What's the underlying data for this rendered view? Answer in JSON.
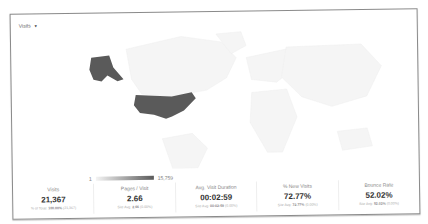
{
  "metric_selector": {
    "label": "Visits",
    "icon": "caret-down-icon"
  },
  "map": {
    "highlighted_regions": [
      "United States",
      "Alaska"
    ],
    "highlight_color": "#5a5a5a",
    "base_color": "#f4f4f4"
  },
  "legend": {
    "min": "1",
    "max": "15,759"
  },
  "metrics": [
    {
      "label": "Visits",
      "value": "21,367",
      "sub_prefix": "% of Total:",
      "sub_value": "100.00%",
      "sub_suffix": "(21,367)"
    },
    {
      "label": "Pages / Visit",
      "value": "2.66",
      "sub_prefix": "Site Avg:",
      "sub_value": "2.66",
      "sub_suffix": "(0.00%)"
    },
    {
      "label": "Avg. Visit Duration",
      "value": "00:02:59",
      "sub_prefix": "Site Avg:",
      "sub_value": "00:02:59",
      "sub_suffix": "(0.00%)"
    },
    {
      "label": "% New Visits",
      "value": "72.77%",
      "sub_prefix": "Site Avg:",
      "sub_value": "72.77%",
      "sub_suffix": "(0.00%)"
    },
    {
      "label": "Bounce Rate",
      "value": "52.02%",
      "sub_prefix": "Site Avg:",
      "sub_value": "52.02%",
      "sub_suffix": "(0.00%)"
    }
  ]
}
